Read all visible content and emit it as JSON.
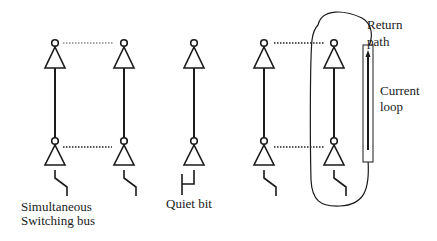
{
  "diagram": {
    "type": "circuit-schematic",
    "stroke_color": "#1a1a1a",
    "background": "#ffffff",
    "columns": [
      {
        "id": "bus-1",
        "x": 55,
        "group": "simultaneous-switching-bus",
        "input": "switch"
      },
      {
        "id": "bus-2",
        "x": 124,
        "group": "simultaneous-switching-bus",
        "input": "switch"
      },
      {
        "id": "quiet",
        "x": 194,
        "group": "quiet-bit",
        "input": "grounded"
      },
      {
        "id": "bus-3",
        "x": 264,
        "group": "simultaneous-switching-bus",
        "input": "switch"
      },
      {
        "id": "bus-4",
        "x": 334,
        "group": "simultaneous-switching-bus",
        "input": "switch"
      }
    ],
    "labels": {
      "bus_line1": "Simultaneous",
      "bus_line2": "Switching bus",
      "quiet": "Quiet bit",
      "return_line1": "Return",
      "return_line2": "path",
      "current_line1": "Current",
      "current_line2": "loop"
    }
  }
}
